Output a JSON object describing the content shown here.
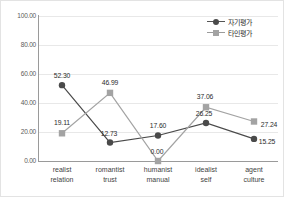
{
  "chart_data": {
    "type": "line",
    "title": "",
    "xlabel": "",
    "ylabel": "",
    "ylim": [
      0,
      100
    ],
    "yticks": [
      "0.00",
      "20.00",
      "40.00",
      "60.00",
      "80.00",
      "100.00"
    ],
    "ytick_values": [
      0,
      20,
      40,
      60,
      80,
      100
    ],
    "grid": true,
    "legend_position": "top-right",
    "categories": [
      "realist\nrelation",
      "romantist\ntrust",
      "humanist\nmanual",
      "idealist\nself",
      "agent\nculture"
    ],
    "category_lines": [
      [
        "realist",
        "relation"
      ],
      [
        "romantist",
        "trust"
      ],
      [
        "humanist",
        "manual"
      ],
      [
        "idealist",
        "self"
      ],
      [
        "agent",
        "culture"
      ]
    ],
    "series": [
      {
        "name": "자기평가",
        "marker": "circle",
        "color": "#4a4a4a",
        "values": [
          52.3,
          12.73,
          17.6,
          26.25,
          15.25
        ],
        "labels": [
          "52.30",
          "12.73",
          "17.60",
          "26.25",
          "15.25"
        ]
      },
      {
        "name": "타인평가",
        "marker": "square",
        "color": "#a3a3a3",
        "values": [
          19.11,
          46.99,
          0.0,
          37.06,
          27.24
        ],
        "labels": [
          "19.11",
          "46.99",
          "0.00",
          "37.06",
          "27.24"
        ]
      }
    ]
  },
  "legend": {
    "items": [
      {
        "label": "자기평가",
        "marker": "circle-marker-icon"
      },
      {
        "label": "타인평가",
        "marker": "square-marker-icon"
      }
    ]
  },
  "colors": {
    "series_self": "#4a4a4a",
    "series_other": "#a3a3a3",
    "axis": "#9a9a9a",
    "grid": "#e8e8e8",
    "text": "#2b2b2b"
  }
}
